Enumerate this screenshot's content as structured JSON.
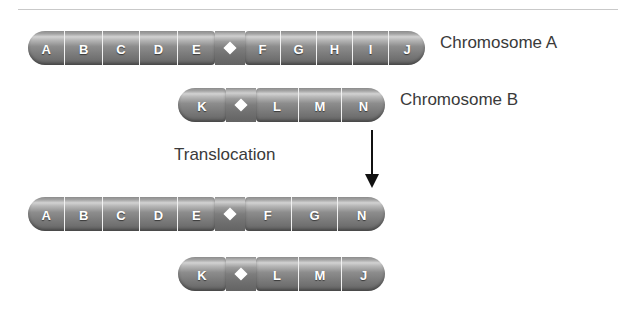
{
  "figure": {
    "process_label": "Translocation",
    "arrow": "down-arrow",
    "colors": {
      "chromosome_body": "#8d8d8d",
      "chromosome_highlight": "#d2d2d2",
      "chromosome_shadow": "#636363",
      "segment_divider": "#f2f2f2",
      "letter": "#ffffff",
      "text": "#3a3a3a",
      "rule": "#c9c9c9",
      "background": "#ffffff"
    }
  },
  "before": {
    "chromosome_a": {
      "name": "Chromosome A",
      "left_arm": [
        "A",
        "B",
        "C",
        "D",
        "E"
      ],
      "right_arm": [
        "F",
        "G",
        "H",
        "I",
        "J"
      ]
    },
    "chromosome_b": {
      "name": "Chromosome B",
      "left_arm": [
        "K"
      ],
      "right_arm": [
        "L",
        "M",
        "N"
      ]
    }
  },
  "after": {
    "chromosome_a": {
      "name": "Chromosome A",
      "left_arm": [
        "A",
        "B",
        "C",
        "D",
        "E"
      ],
      "right_arm": [
        "F",
        "G",
        "N"
      ]
    },
    "chromosome_b": {
      "name": "Chromosome B",
      "left_arm": [
        "K"
      ],
      "right_arm": [
        "L",
        "M",
        "J"
      ]
    }
  }
}
